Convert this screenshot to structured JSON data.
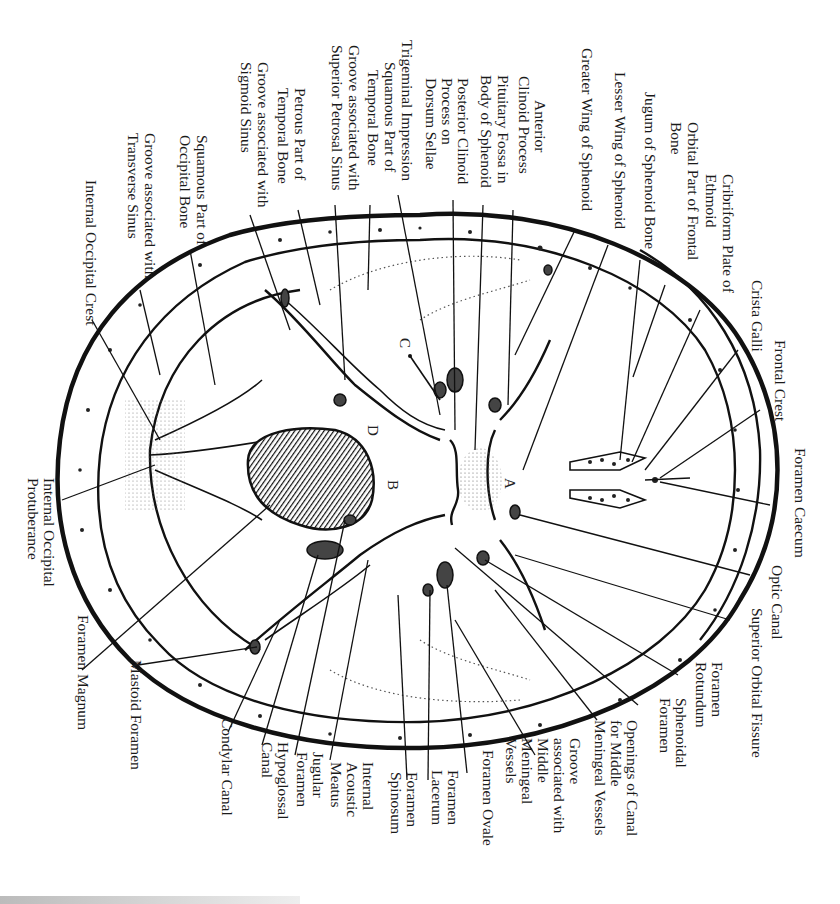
{
  "figure": {
    "region_letters": [
      "A",
      "B",
      "C",
      "D"
    ]
  },
  "labels": {
    "top": [
      "Trigeminal Impression",
      "Squamous Part of Temporal Bone",
      "Groove associated with Superior Petrosal Sinus",
      "Petrous Part of Temporal Bone",
      "Groove associated with Sigmoid Sinus",
      "Squamous Part of Occipital Bone",
      "Groove associated with Transverse Sinus",
      "Internal Occipital Crest",
      "Posterior Clinoid Process on Dorsum Sellae",
      "Pituitary Fossa in Body of Sphenoid",
      "Anterior Clinoid Process",
      "Greater Wing of Sphenoid",
      "Lesser Wing of Sphenoid",
      "Jugum of Sphenoid Bone",
      "Orbital Part of Frontal Bone",
      "Cribriform Plate of Ethmoid",
      "Crista Galli",
      "Frontal Crest"
    ],
    "right": [
      "Foramen Caecum",
      "Optic Canal",
      "Superior Orbital Fissure",
      "Foramen Rotundum",
      "Sphenoidal Foramen",
      "Openings of Canal for Middle Meningeal Vessels"
    ],
    "bottom": [
      "Groove associated with Middle Meningeal Vessels",
      "Foramen Ovale",
      "Foramen Lacerum",
      "Foramen Spinosum",
      "Internal Acoustic Meatus",
      "Jugular Foramen",
      "Hypoglossal Canal",
      "Condylar Canal",
      "Mastoid Foramen",
      "Foramen Magnum"
    ],
    "left": [
      "Internal Occipital Protuberance"
    ]
  },
  "lines": {
    "trigeminal_impression": [
      "Trigeminal Impression"
    ],
    "squamous_temporal": [
      "Squamous Part of",
      "Temporal Bone"
    ],
    "groove_sup_petrosal": [
      "Groove associated with",
      "Superior Petrosal Sinus"
    ],
    "petrous_temporal": [
      "Petrous Part of",
      "Temporal Bone"
    ],
    "groove_sigmoid": [
      "Groove associated with",
      "Sigmoid Sinus"
    ],
    "squamous_occipital": [
      "Squamous Part of",
      "Occipital Bone"
    ],
    "groove_transverse": [
      "Groove associated with",
      "Transverse Sinus"
    ],
    "internal_occipital_crest": [
      "Internal Occipital Crest"
    ],
    "posterior_clinoid": [
      "Posterior Clinoid",
      "Process on",
      "Dorsum Sellae"
    ],
    "pituitary_fossa": [
      "Pituitary Fossa in",
      "Body of Sphenoid"
    ],
    "anterior_clinoid": [
      "Anterior",
      "Clinoid Process"
    ],
    "greater_wing": [
      "Greater Wing of Sphenoid"
    ],
    "lesser_wing": [
      "Lesser Wing of Sphenoid"
    ],
    "jugum": [
      "Jugum of Sphenoid Bone"
    ],
    "orbital_frontal": [
      "Orbital Part of Frontal",
      "Bone"
    ],
    "cribriform": [
      "Cribriform Plate of",
      "Ethmoid"
    ],
    "crista_galli": [
      "Crista Galli"
    ],
    "frontal_crest": [
      "Frontal Crest"
    ],
    "foramen_caecum": [
      "Foramen Caecum"
    ],
    "optic_canal": [
      "Optic Canal"
    ],
    "sup_orbital_fissure": [
      "Superior Orbital Fissure"
    ],
    "foramen_rotundum": [
      "Foramen",
      "Rotundum"
    ],
    "sphenoidal_foramen": [
      "Sphenoidal",
      "Foramen"
    ],
    "openings_canal": [
      "Openings of Canal",
      "for Middle",
      "Meningeal Vessels"
    ],
    "groove_middle_meningeal": [
      "Groove",
      "associated with",
      "Middle",
      "Meningeal",
      "Vessels"
    ],
    "foramen_ovale": [
      "Foramen Ovale"
    ],
    "foramen_lacerum": [
      "Foramen",
      "Lacerum"
    ],
    "foramen_spinosum": [
      "Foramen",
      "Spinosum"
    ],
    "internal_acoustic": [
      "Internal",
      "Acoustic",
      "Meatus"
    ],
    "jugular_foramen": [
      "Jugular",
      "Foramen"
    ],
    "hypoglossal": [
      "Hypoglossal",
      "Canal"
    ],
    "condylar": [
      "Condylar Canal"
    ],
    "mastoid": [
      "Mastoid Foramen"
    ],
    "foramen_magnum": [
      "Foramen Magnum"
    ],
    "int_occ_protuberance": [
      "Internal Occipital",
      "Protuberance"
    ]
  },
  "colors": {
    "ink": "#111111",
    "background": "#ffffff",
    "hatch_fill": "#444444"
  }
}
